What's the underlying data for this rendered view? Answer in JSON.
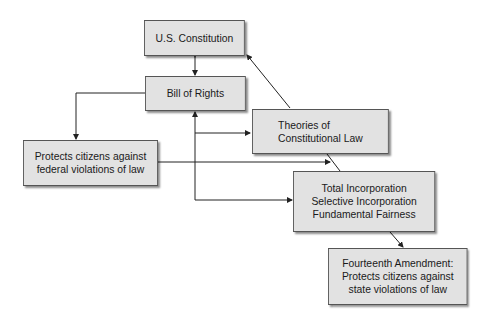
{
  "diagram": {
    "nodes": {
      "constitution": "U.S. Constitution",
      "bill_of_rights": "Bill of Rights",
      "theories": "Theories of\nConstitutional Law",
      "federal_protection": "Protects citizens against\nfederal violations of law",
      "incorporation": "Total Incorporation\nSelective Incorporation\nFundamental Fairness",
      "fourteenth": "Fourteenth Amendment:\nProtects citizens against\nstate violations of law"
    },
    "edges": [
      {
        "from": "constitution",
        "to": "bill_of_rights",
        "type": "bidirectional"
      },
      {
        "from": "bill_of_rights",
        "to": "federal_protection"
      },
      {
        "from": "bill_of_rights",
        "to": "theories"
      },
      {
        "from": "bill_of_rights",
        "to": "incorporation"
      },
      {
        "from": "federal_protection",
        "to": "incorporation"
      },
      {
        "from": "incorporation",
        "to": "bill_of_rights"
      },
      {
        "from": "theories",
        "to": "constitution"
      },
      {
        "from": "incorporation",
        "to": "fourteenth"
      }
    ],
    "colors": {
      "box_fill": "#e2e2e2",
      "box_border": "#555555",
      "line": "#222222"
    }
  }
}
